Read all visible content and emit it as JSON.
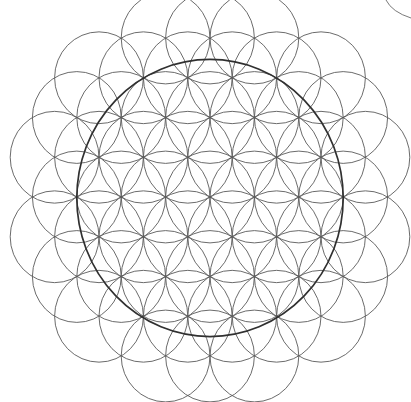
{
  "figure": {
    "line_color": "#5a5a5a",
    "bounding_circle_color": "#303030",
    "background_color": "#ffffff",
    "pattern": {
      "lattice": "triangular",
      "inclusion_rule_max_center_distance_in_radii": 3.61,
      "bounding_circle_radius_in_radii": 3
    }
  }
}
